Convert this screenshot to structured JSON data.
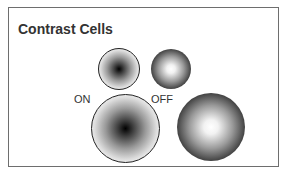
{
  "figure": {
    "title": "Contrast Cells",
    "labels": {
      "on": "ON",
      "off": "OFF"
    },
    "cells": [
      {
        "type": "on-center",
        "size": "small",
        "center_fill": "#000000",
        "surround_fill": "#ffffff",
        "outline": "#222222"
      },
      {
        "type": "off-center",
        "size": "small",
        "center_fill": "#ffffff",
        "surround_fill": "#0d0d0d"
      },
      {
        "type": "on-center",
        "size": "large",
        "center_fill": "#000000",
        "surround_fill": "#ffffff",
        "outline": "#222222"
      },
      {
        "type": "off-center",
        "size": "large",
        "center_fill": "#ffffff",
        "surround_fill": "#0d0d0d"
      }
    ],
    "frame_color": "#6e6e6e",
    "text_color": "#333333"
  }
}
